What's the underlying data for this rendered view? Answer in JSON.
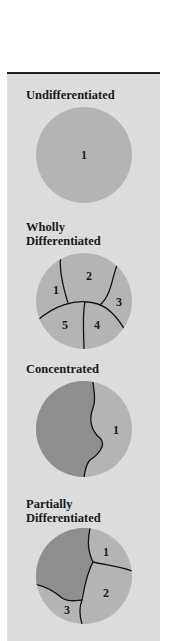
{
  "colors": {
    "panel_background": "#dcdcdc",
    "light_region": "#b4b4b4",
    "dark_region": "#8e8e8e",
    "boundary_line": "#111111"
  },
  "diagrams": [
    {
      "title": "Undifferentiated",
      "regions": [
        "1"
      ]
    },
    {
      "title_line1": "Wholly",
      "title_line2": "Differentiated",
      "regions": [
        "1",
        "2",
        "3",
        "4",
        "5"
      ]
    },
    {
      "title": "Concentrated",
      "regions": [
        "1"
      ]
    },
    {
      "title_line1": "Partially",
      "title_line2": "Differentiated",
      "regions": [
        "1",
        "2",
        "3"
      ]
    }
  ]
}
